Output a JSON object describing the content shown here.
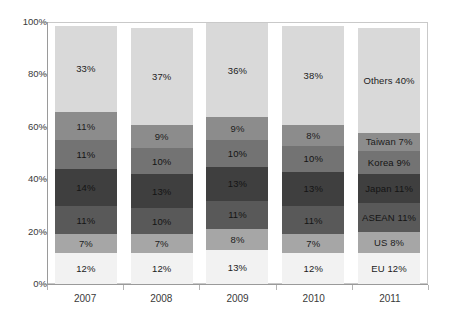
{
  "chart_data": {
    "type": "bar",
    "variant": "stacked-100-percent",
    "title": "",
    "subtitle": "",
    "xlabel": "",
    "ylabel": "",
    "categories": [
      "2007",
      "2008",
      "2009",
      "2010",
      "2011"
    ],
    "ylim": [
      0,
      100
    ],
    "y_ticks": [
      "0%",
      "20%",
      "40%",
      "60%",
      "80%",
      "100%"
    ],
    "y_tick_values": [
      0,
      20,
      40,
      60,
      80,
      100
    ],
    "grid": false,
    "legend": "none",
    "labels_on_last_bar_include_series_name": true,
    "stack_order_bottom_to_top": [
      "EU",
      "US",
      "ASEAN",
      "Japan",
      "Korea",
      "Taiwan",
      "Others"
    ],
    "series": [
      {
        "name": "EU",
        "color": "#f2f2f2",
        "values": [
          12,
          12,
          13,
          12,
          12
        ]
      },
      {
        "name": "US",
        "color": "#a6a6a6",
        "values": [
          7,
          7,
          8,
          7,
          8
        ]
      },
      {
        "name": "ASEAN",
        "color": "#595959",
        "values": [
          11,
          10,
          11,
          11,
          11
        ]
      },
      {
        "name": "Japan",
        "color": "#3f3f3f",
        "values": [
          14,
          13,
          13,
          13,
          11
        ]
      },
      {
        "name": "Korea",
        "color": "#737373",
        "values": [
          11,
          10,
          10,
          10,
          9
        ]
      },
      {
        "name": "Taiwan",
        "color": "#8c8c8c",
        "values": [
          11,
          9,
          9,
          8,
          7
        ]
      },
      {
        "name": "Others",
        "color": "#d9d9d9",
        "values": [
          33,
          37,
          36,
          38,
          40
        ]
      }
    ],
    "bar_labels": [
      [
        "12%",
        "7%",
        "11%",
        "14%",
        "11%",
        "11%",
        "33%"
      ],
      [
        "12%",
        "7%",
        "10%",
        "13%",
        "10%",
        "9%",
        "37%"
      ],
      [
        "13%",
        "8%",
        "11%",
        "13%",
        "10%",
        "9%",
        "36%"
      ],
      [
        "12%",
        "7%",
        "11%",
        "13%",
        "10%",
        "8%",
        "38%"
      ],
      [
        "EU 12%",
        "US 8%",
        "ASEAN 11%",
        "Japan 11%",
        "Korea 9%",
        "Taiwan 7%",
        "Others 40%"
      ]
    ]
  },
  "colors": {
    "background": "#ffffff",
    "axis_line": "#9a9a9a",
    "plot_border": "#c9c9c9",
    "tick_mark": "#b4b4b4",
    "text": "#3a3a3a",
    "label_text": "#1c1c1c"
  }
}
